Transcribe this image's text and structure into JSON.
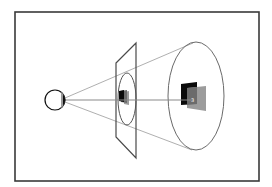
{
  "diagram": {
    "colors": {
      "background": "#ffffff",
      "frame": "#3a3a3a",
      "lines": "#9a9a9a",
      "plane": "#4a4a4a",
      "ellipse": "#6a6a6a",
      "square_dark": "#0a0a0a",
      "square_mid": "#6b6b6b",
      "square_light": "#9c9c9c",
      "eye_outline": "#111111",
      "axis": "#8a8a8a"
    },
    "frame": {
      "x": 15,
      "y": 12,
      "width": 244,
      "height": 169
    },
    "eye": {
      "cx": 55,
      "cy": 100,
      "r": 10
    },
    "image_plane": {
      "points": "116,63 136,43 136,158 116,137"
    },
    "small_ellipse": {
      "cx": 127,
      "cy": 99,
      "rx": 9,
      "ry": 26
    },
    "large_ellipse": {
      "cx": 196,
      "cy": 96,
      "rx": 28,
      "ry": 54
    },
    "projection_label": "3"
  }
}
